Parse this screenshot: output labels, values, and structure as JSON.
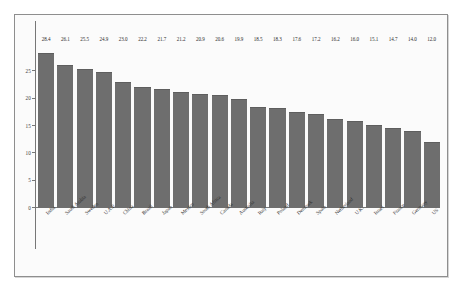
{
  "chart_data": {
    "type": "bar",
    "title": "",
    "subtitle": "",
    "xlabel": "",
    "ylabel": "",
    "ylim": [
      0,
      30
    ],
    "yticks": [
      0,
      5,
      10,
      15,
      20,
      25
    ],
    "grid": false,
    "legend": null,
    "orientation": "vertical",
    "bar_color": "#6e6e6e",
    "categories": [
      "India",
      "Saudi Arabia",
      "Sweden",
      "U.A.E",
      "China",
      "Brazil",
      "Japan",
      "Mexico",
      "South Africa",
      "Canada",
      "Australia",
      "Italy",
      "Poland",
      "Denmark",
      "Spain",
      "Netherland",
      "U.K.",
      "Israel",
      "France",
      "Germany",
      "US"
    ],
    "values": [
      28.4,
      26.1,
      25.5,
      24.9,
      23.0,
      22.2,
      21.7,
      21.2,
      20.9,
      20.6,
      19.9,
      18.5,
      18.3,
      17.6,
      17.2,
      16.2,
      16.0,
      15.1,
      14.7,
      14.0,
      12.0
    ],
    "data_labels": [
      "28.4",
      "26.1",
      "25.5",
      "24.9",
      "23.0",
      "22.2",
      "21.7",
      "21.2",
      "20.9",
      "20.6",
      "19.9",
      "18.5",
      "18.3",
      "17.6",
      "17.2",
      "16.2",
      "16.0",
      "15.1",
      "14.7",
      "14.0",
      "12.0"
    ]
  }
}
